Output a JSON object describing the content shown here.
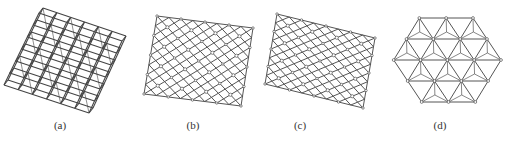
{
  "figure": {
    "panels": [
      {
        "id": "a",
        "label": "(a)",
        "type": "cubic-lattice-grid",
        "corners": [
          [
            43,
            8
          ],
          [
            126,
            36
          ],
          [
            93,
            108
          ],
          [
            8,
            80
          ]
        ],
        "grid": 6,
        "label_x": 60
      },
      {
        "id": "b",
        "label": "(b)",
        "type": "octet-truss-lattice-square",
        "corners": [
          [
            157,
            16
          ],
          [
            253,
            28
          ],
          [
            241,
            106
          ],
          [
            144,
            94
          ]
        ],
        "grid": 4,
        "label_x": 193
      },
      {
        "id": "c",
        "label": "(c)",
        "type": "octet-truss-lattice-rect",
        "corners": [
          [
            277,
            14
          ],
          [
            375,
            38
          ],
          [
            363,
            108
          ],
          [
            265,
            84
          ]
        ],
        "grid": 4,
        "label_x": 300
      },
      {
        "id": "d",
        "label": "(d)",
        "type": "octet-truss-lattice-hexagonal",
        "hexagon": [
          [
            418,
            17
          ],
          [
            473,
            18
          ],
          [
            501,
            60
          ],
          [
            479,
            103
          ],
          [
            420,
            104
          ],
          [
            393,
            58
          ]
        ],
        "label_x": 440
      }
    ],
    "colors": {
      "stroke": "#4a4a4a",
      "node": "#ffffff",
      "background": "#ffffff"
    }
  }
}
